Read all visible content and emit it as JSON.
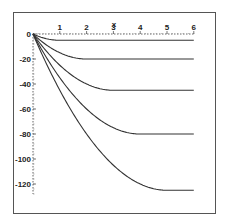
{
  "chart_data": {
    "type": "line",
    "title": "",
    "xlabel": "x",
    "ylabel": "",
    "xlim": [
      0,
      6
    ],
    "ylim": [
      -130,
      0
    ],
    "x_ticks": [
      1,
      2,
      3,
      4,
      5,
      6
    ],
    "y_ticks": [
      0,
      -20,
      -40,
      -60,
      -80,
      -100,
      -120
    ],
    "x_tick_labels": [
      "1",
      "2",
      "3",
      "4",
      "5",
      "6"
    ],
    "y_tick_labels": [
      "0",
      "-20",
      "-40",
      "-60",
      "-80",
      "-100",
      "-120"
    ],
    "grid": false,
    "legend": null,
    "frame": true,
    "line_color": "#333333",
    "series": [
      {
        "name": "T=1",
        "x": [
          0,
          0.25,
          0.5,
          0.75,
          1,
          6
        ],
        "values": [
          0,
          -2.19,
          -3.75,
          -4.69,
          -5,
          -5
        ]
      },
      {
        "name": "T=2",
        "x": [
          0,
          0.5,
          1,
          1.5,
          2,
          6
        ],
        "values": [
          0,
          -8.75,
          -15,
          -18.75,
          -20,
          -20
        ]
      },
      {
        "name": "T=3",
        "x": [
          0,
          0.75,
          1.5,
          2.25,
          3,
          6
        ],
        "values": [
          0,
          -19.69,
          -33.75,
          -42.19,
          -45,
          -45
        ]
      },
      {
        "name": "T=4",
        "x": [
          0,
          1,
          2,
          3,
          4,
          6
        ],
        "values": [
          0,
          -35,
          -60,
          -75,
          -80,
          -80
        ]
      },
      {
        "name": "T=5",
        "x": [
          0,
          1.25,
          2.5,
          3.75,
          5,
          6
        ],
        "values": [
          0,
          -54.69,
          -93.75,
          -117.19,
          -125,
          -125
        ]
      }
    ]
  }
}
